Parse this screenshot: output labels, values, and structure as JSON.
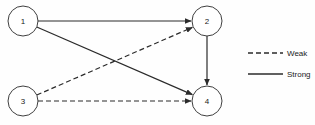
{
  "diagram": {
    "type": "directed-graph",
    "background_color": "#fefefe",
    "stroke_color": "#2b2b2b",
    "node_fill": "#ffffff",
    "node_stroke": "#3f3f3f",
    "nodes": [
      {
        "id": "1",
        "label": "1",
        "cx": 23,
        "cy": 21,
        "r": 15
      },
      {
        "id": "2",
        "label": "2",
        "cx": 207,
        "cy": 21,
        "r": 15
      },
      {
        "id": "3",
        "label": "3",
        "cx": 23,
        "cy": 101,
        "r": 15
      },
      {
        "id": "4",
        "label": "4",
        "cx": 207,
        "cy": 101,
        "r": 15
      }
    ],
    "edges": [
      {
        "id": "e1",
        "from": "1",
        "to": "2",
        "style": "solid",
        "strength": "Strong"
      },
      {
        "id": "e2",
        "from": "1",
        "to": "4",
        "style": "solid",
        "strength": "Strong"
      },
      {
        "id": "e3",
        "from": "2",
        "to": "4",
        "style": "solid",
        "strength": "Strong"
      },
      {
        "id": "e4",
        "from": "3",
        "to": "2",
        "style": "dashed",
        "strength": "Weak"
      },
      {
        "id": "e5",
        "from": "3",
        "to": "4",
        "style": "dashed",
        "strength": "Weak"
      }
    ]
  },
  "legend": {
    "items": [
      {
        "id": "weak",
        "label": "Weak",
        "style": "dashed",
        "x1": 248,
        "x2": 283,
        "y": 53,
        "text_x": 287
      },
      {
        "id": "strong",
        "label": "Strong",
        "style": "solid",
        "x1": 248,
        "x2": 283,
        "y": 74,
        "text_x": 287
      }
    ]
  }
}
